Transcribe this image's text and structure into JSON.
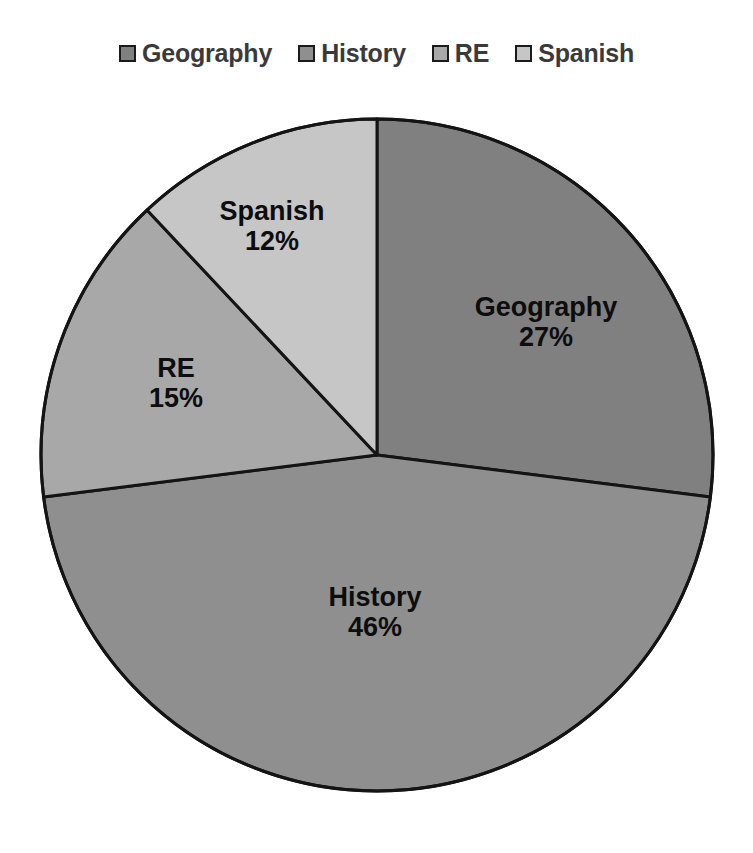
{
  "chart_data": {
    "type": "pie",
    "title": "",
    "categories": [
      "Geography",
      "History",
      "RE",
      "Spanish"
    ],
    "values": [
      27,
      46,
      15,
      12
    ],
    "value_suffix": "%",
    "data_labels": [
      "27%",
      "46%",
      "15%",
      "12%"
    ],
    "start_angle_deg": 0,
    "direction": "clockwise",
    "legend": {
      "position": "top",
      "entries": [
        {
          "label": "Geography",
          "color": "#808080"
        },
        {
          "label": "History",
          "color": "#8f8f8f"
        },
        {
          "label": "RE",
          "color": "#a8a8a8"
        },
        {
          "label": "Spanish",
          "color": "#c6c6c6"
        }
      ]
    },
    "slices": [
      {
        "name": "Geography",
        "value": 27,
        "label": "Geography",
        "pct_label": "27%",
        "color": "#808080",
        "start_deg": 0,
        "end_deg": 97.2
      },
      {
        "name": "History",
        "value": 46,
        "label": "History",
        "pct_label": "46%",
        "color": "#8f8f8f",
        "start_deg": 97.2,
        "end_deg": 262.8
      },
      {
        "name": "RE",
        "value": 15,
        "label": "RE",
        "pct_label": "15%",
        "color": "#a8a8a8",
        "start_deg": 262.8,
        "end_deg": 316.8
      },
      {
        "name": "Spanish",
        "value": 12,
        "label": "Spanish",
        "pct_label": "12%",
        "color": "#c6c6c6",
        "start_deg": 316.8,
        "end_deg": 360
      }
    ],
    "geometry": {
      "center_x": 377,
      "center_y": 455,
      "radius": 336
    },
    "style": {
      "background": "#ffffff",
      "slice_border_color": "#141414",
      "slice_border_width": 3,
      "label_color": "#0d0d0d",
      "legend_text_color": "#3a3a3a"
    }
  }
}
